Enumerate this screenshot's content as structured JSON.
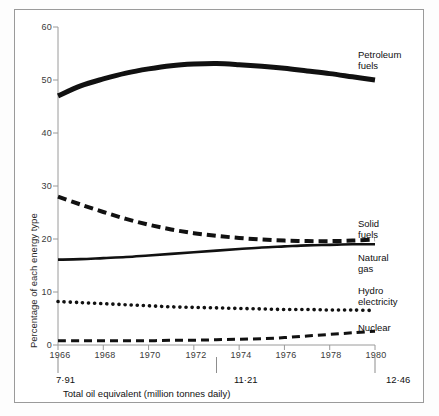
{
  "chart_data": {
    "type": "line",
    "title": "",
    "xlabel": "Total oil equivalent (million tonnes daily)",
    "ylabel": "Percentage of each energy type",
    "xlim": [
      1966,
      1980
    ],
    "ylim": [
      0,
      60
    ],
    "grid": false,
    "legend_position": "right-inline",
    "x": [
      1966,
      1967,
      1968,
      1969,
      1970,
      1971,
      1972,
      1973,
      1974,
      1975,
      1976,
      1977,
      1978,
      1979,
      1980
    ],
    "y_ticks": [
      0,
      10,
      20,
      30,
      40,
      50,
      60
    ],
    "x_ticks": [
      1966,
      1968,
      1970,
      1972,
      1974,
      1976,
      1978,
      1980
    ],
    "secondary_axis": {
      "label": "Total oil equivalent (million tonnes daily)",
      "ticks": [
        {
          "x": 1966,
          "value": "7·91"
        },
        {
          "x": 1973,
          "value": "11·21"
        },
        {
          "x": 1980,
          "value": "12·46"
        }
      ]
    },
    "series": [
      {
        "name": "Petroleum fuels",
        "label_lines": [
          "Petroleum",
          "fuels"
        ],
        "style": "solid-thick",
        "values": [
          47.0,
          48.9,
          50.2,
          51.3,
          52.1,
          52.7,
          53.0,
          53.1,
          52.9,
          52.6,
          52.2,
          51.7,
          51.2,
          50.6,
          50.0
        ]
      },
      {
        "name": "Solid fuels",
        "label_lines": [
          "Solid",
          "fuels"
        ],
        "style": "dashed-thick",
        "values": [
          28.0,
          26.5,
          25.1,
          23.8,
          22.7,
          21.8,
          21.1,
          20.6,
          20.2,
          19.9,
          19.7,
          19.6,
          19.6,
          19.7,
          19.9
        ]
      },
      {
        "name": "Natural gas",
        "label_lines": [
          "Natural",
          "gas"
        ],
        "style": "solid-medium",
        "values": [
          16.1,
          16.2,
          16.4,
          16.6,
          16.9,
          17.2,
          17.5,
          17.8,
          18.1,
          18.4,
          18.6,
          18.8,
          18.9,
          19.0,
          19.0
        ]
      },
      {
        "name": "Hydro electricity",
        "label_lines": [
          "Hydro",
          "electricity"
        ],
        "style": "dotted",
        "values": [
          8.2,
          8.0,
          7.8,
          7.6,
          7.4,
          7.2,
          7.1,
          7.0,
          6.9,
          6.8,
          6.7,
          6.7,
          6.6,
          6.6,
          6.5
        ]
      },
      {
        "name": "Nuclear",
        "label_lines": [
          "Nuclear"
        ],
        "style": "dashed-thin",
        "values": [
          0.8,
          0.8,
          0.8,
          0.8,
          0.8,
          0.9,
          0.9,
          1.0,
          1.1,
          1.2,
          1.4,
          1.7,
          2.0,
          2.3,
          2.6
        ]
      }
    ]
  },
  "axis": {
    "y_tick_labels": [
      "60",
      "50",
      "40",
      "30",
      "20",
      "10",
      "0"
    ],
    "x_tick_labels": [
      "1966",
      "1968",
      "1970",
      "1972",
      "1974",
      "1976",
      "1978",
      "1980"
    ],
    "y_title": "Percentage of each energy type"
  },
  "oil_axis": {
    "caption": "Total oil equivalent (million tonnes daily)",
    "tick_labels": [
      "7·91",
      "11·21",
      "12·46"
    ]
  },
  "series_labels": {
    "petroleum_1": "Petroleum",
    "petroleum_2": "fuels",
    "solid_1": "Solid",
    "solid_2": "fuels",
    "gas_1": "Natural",
    "gas_2": "gas",
    "hydro_1": "Hydro",
    "hydro_2": "electricity",
    "nuclear_1": "Nuclear"
  },
  "colors": {
    "ink": "#111111",
    "axis": "#9a9a9a",
    "frame": "#9a9a9a",
    "background": "#ffffff"
  }
}
